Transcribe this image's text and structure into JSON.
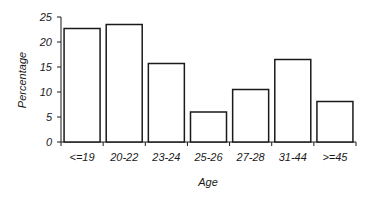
{
  "chart_data": {
    "type": "bar",
    "title": "",
    "xlabel": "Age",
    "ylabel": "Percentage",
    "categories": [
      "<=19",
      "20-22",
      "23-24",
      "25-26",
      "27-28",
      "31-44",
      ">=45"
    ],
    "values": [
      22.7,
      23.5,
      15.7,
      6.0,
      10.5,
      16.5,
      8.1
    ],
    "ylim": [
      0,
      25
    ],
    "yticks": [
      0,
      5,
      10,
      15,
      20,
      25
    ],
    "grid": false,
    "legend": null,
    "bar_fill": "#ffffff",
    "bar_stroke": "#1a1a1a"
  }
}
